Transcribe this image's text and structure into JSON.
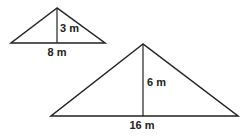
{
  "diagram": {
    "line_color": "#222222",
    "triangles": [
      {
        "name": "small",
        "height_label": "3 m",
        "base_label": "8 m",
        "apex": [
          57,
          8
        ],
        "base_left": [
          11,
          43
        ],
        "base_right": [
          105,
          43
        ]
      },
      {
        "name": "large",
        "height_label": "6 m",
        "base_label": "16 m",
        "apex": [
          143,
          44
        ],
        "base_left": [
          10,
          116
        ],
        "base_right": [
          238,
          116
        ]
      }
    ]
  }
}
